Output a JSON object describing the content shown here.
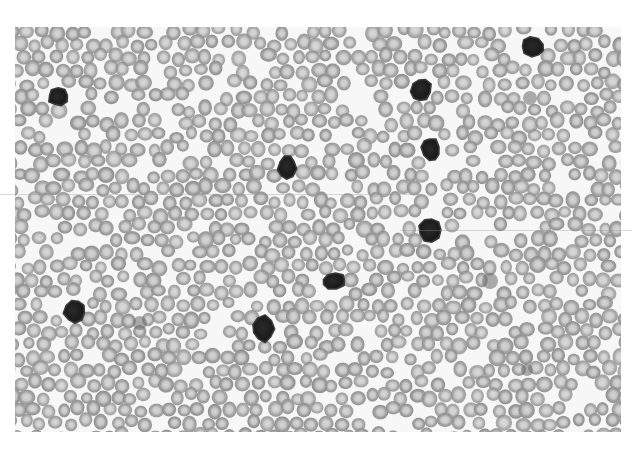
{
  "image": {
    "subject": "Peripheral blood smear micrograph (grayscale)",
    "width": 632,
    "height": 450,
    "frame": {
      "x": 15,
      "y": 27,
      "width": 606,
      "height": 405
    },
    "background_color": "#ffffff",
    "field_color": "#f7f7f7"
  },
  "colors": {
    "rbc_ring": "#9a9a9a",
    "rbc_ring_dark": "#8a8a8a",
    "rbc_center": "#c8c8c8",
    "nucleus": "#1e1e1e",
    "nucleus_edge": "#3a3a3a",
    "platelet": "#6a6a6a"
  },
  "rbc": {
    "radius": 7,
    "ring_width": 3.4,
    "spacing": 15,
    "seed": 7331,
    "coverage": 0.86
  },
  "lymphocytes": [
    {
      "cx": 58,
      "cy": 97,
      "rx": 10,
      "ry": 9,
      "rot": -10
    },
    {
      "cx": 533,
      "cy": 47,
      "rx": 12,
      "ry": 10,
      "rot": 20
    },
    {
      "cx": 421,
      "cy": 90,
      "rx": 10,
      "ry": 12,
      "rot": 15
    },
    {
      "cx": 287,
      "cy": 167,
      "rx": 9,
      "ry": 12,
      "rot": 10
    },
    {
      "cx": 431,
      "cy": 149,
      "rx": 9,
      "ry": 12,
      "rot": -15
    },
    {
      "cx": 430,
      "cy": 230,
      "rx": 11,
      "ry": 12,
      "rot": 0
    },
    {
      "cx": 334,
      "cy": 281,
      "rx": 12,
      "ry": 8,
      "rot": -5
    },
    {
      "cx": 75,
      "cy": 311,
      "rx": 11,
      "ry": 12,
      "rot": 10
    },
    {
      "cx": 263,
      "cy": 329,
      "rx": 11,
      "ry": 13,
      "rot": 0
    }
  ],
  "faint_cells": [
    {
      "cx": 490,
      "cy": 281,
      "r": 8
    },
    {
      "cx": 530,
      "cy": 98,
      "r": 7
    },
    {
      "cx": 140,
      "cy": 323,
      "r": 7
    },
    {
      "cx": 527,
      "cy": 370,
      "r": 6
    }
  ],
  "scanlines": [
    {
      "x": 0,
      "y": 194,
      "width": 420
    },
    {
      "x": 400,
      "y": 230,
      "width": 232
    }
  ]
}
